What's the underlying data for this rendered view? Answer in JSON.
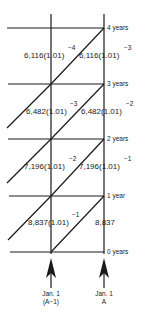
{
  "diagram": {
    "type": "lexis-diagram",
    "year_lines": [
      {
        "label": "4 years",
        "y": 28
      },
      {
        "label": "3 years",
        "y": 84
      },
      {
        "label": "2 years",
        "y": 139
      },
      {
        "label": "1 year",
        "y": 196
      },
      {
        "label": "0 years",
        "y": 252
      }
    ],
    "cells": [
      {
        "row": 0,
        "left": {
          "base": "6,116(1.01)",
          "exp": "−4"
        },
        "right": {
          "base": "6,116(1.01)",
          "exp": "−3"
        }
      },
      {
        "row": 1,
        "left": {
          "base": "6,482(1.01)",
          "exp": "−3"
        },
        "right": {
          "base": "6,482(1.01)",
          "exp": "−2"
        }
      },
      {
        "row": 2,
        "left": {
          "base": "7,196(1.01)",
          "exp": "−2"
        },
        "right": {
          "base": "7,196(1.01)",
          "exp": "−1"
        }
      },
      {
        "row": 3,
        "left": {
          "base": "8,837(1.01)",
          "exp": "−1"
        },
        "right": {
          "base": "8,837",
          "exp": ""
        }
      }
    ],
    "arrows": [
      {
        "line1": "Jan. 1",
        "line2": "(A−1)"
      },
      {
        "line1": "Jan. 1",
        "line2": "A"
      }
    ],
    "line_color": "#1a1a1a"
  }
}
